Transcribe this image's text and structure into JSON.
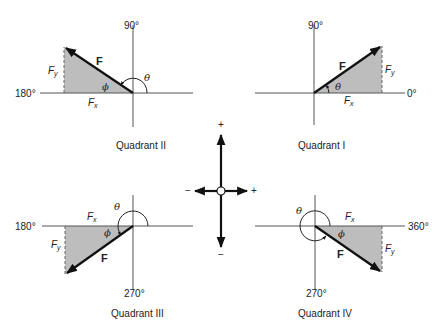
{
  "figure": {
    "colors": {
      "vector": "#111111",
      "axis": "#555555",
      "shade": "#bdbdbd",
      "text": "#222222"
    },
    "labels": {
      "force": "F",
      "fx_main": "F",
      "fx_sub": "x",
      "fy_main": "F",
      "fy_sub": "y",
      "theta": "θ",
      "phi": "ϕ"
    },
    "quadrants": [
      {
        "id": "II",
        "caption": "Quadrant II",
        "top_axis": "90°",
        "side_axis": "180°"
      },
      {
        "id": "I",
        "caption": "Quadrant I",
        "top_axis": "90°",
        "side_axis": "0°"
      },
      {
        "id": "III",
        "caption": "Quadrant III",
        "bottom_axis": "270°",
        "side_axis": "180°"
      },
      {
        "id": "IV",
        "caption": "Quadrant IV",
        "bottom_axis": "270°",
        "side_axis": "360°"
      }
    ],
    "sign_convention": {
      "up": "+",
      "down": "−",
      "left": "−",
      "right": "+"
    }
  }
}
